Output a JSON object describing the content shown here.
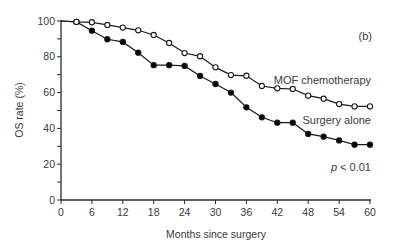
{
  "chart_data": {
    "type": "line",
    "title": "",
    "panel_label": "(b)",
    "xlabel": "Months since surgery",
    "ylabel": "OS rate (%)",
    "xlim": [
      0,
      60
    ],
    "ylim": [
      0,
      100
    ],
    "xticks": [
      0,
      6,
      12,
      18,
      24,
      30,
      36,
      42,
      48,
      54,
      60
    ],
    "yticks": [
      0,
      20,
      40,
      60,
      80,
      100
    ],
    "grid": false,
    "legend": "inline labels next to curves",
    "series": [
      {
        "name": "MOF chemotherapy",
        "marker": "open-circle",
        "x": [
          0,
          3,
          6,
          9,
          12,
          15,
          18,
          21,
          24,
          27,
          30,
          33,
          36,
          39,
          42,
          45,
          48,
          51,
          54,
          57,
          60
        ],
        "y": [
          100,
          99.5,
          99.3,
          97.8,
          96.3,
          94.8,
          92.2,
          87.7,
          82.1,
          80.3,
          74.1,
          69.8,
          69.4,
          63.7,
          62.4,
          62.0,
          58.3,
          56.6,
          53.6,
          52.3,
          52.3
        ],
        "label_position": {
          "x": 44,
          "y": 67
        }
      },
      {
        "name": "Surgery alone",
        "marker": "filled-circle",
        "x": [
          0,
          3,
          6,
          9,
          12,
          15,
          18,
          21,
          24,
          27,
          30,
          33,
          36,
          39,
          42,
          45,
          48,
          51,
          54,
          57,
          60
        ],
        "y": [
          100,
          99.5,
          94.6,
          89.8,
          88.3,
          82.3,
          75.3,
          75.3,
          74.9,
          69.3,
          64.8,
          60.0,
          51.8,
          46.2,
          43.2,
          43.2,
          36.9,
          35.4,
          33.3,
          30.9,
          30.9
        ],
        "label_position": {
          "x": 47,
          "y": 52
        }
      }
    ],
    "annotations": [
      {
        "text": "p < 0.01",
        "italic_part": "p",
        "rest": " < 0.01",
        "x": 51,
        "y": 20
      }
    ]
  },
  "labels": {
    "panel": "(b)",
    "xlabel": "Months since surgery",
    "ylabel": "OS rate (%)",
    "series1": "MOF chemotherapy",
    "series2": "Surgery alone",
    "p_italic": "p",
    "p_rest": " < 0.01"
  },
  "colors": {
    "axis": "#2a2a2a",
    "line": "#1a1a1a",
    "marker_fill_open": "#ffffff",
    "marker_fill_filled": "#000000",
    "text": "#3a3a3a"
  }
}
